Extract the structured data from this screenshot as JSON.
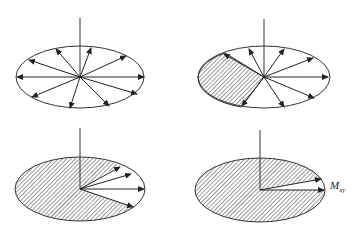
{
  "figure": {
    "stroke_color": "#333333",
    "hatch_color": "#555555",
    "panels": [
      {
        "id": "panel-1",
        "center": [
          80,
          77
        ],
        "rx": 64,
        "ry": 31,
        "axis_top": 18,
        "shaded": "none",
        "vector_angles_deg": [
          0,
          22,
          60,
          82,
          122,
          162,
          180,
          205,
          258,
          308,
          340
        ]
      },
      {
        "id": "panel-2",
        "center": [
          264,
          77
        ],
        "rx": 66,
        "ry": 31,
        "axis_top": 19,
        "shaded": "left-sector",
        "vector_angles_deg": [
          0,
          25,
          65,
          115,
          145,
          240,
          288,
          335
        ]
      },
      {
        "id": "panel-3",
        "center": [
          80,
          189
        ],
        "rx": 65,
        "ry": 32,
        "axis_top": 128,
        "shaded": "mostly",
        "vector_angles_deg": [
          0,
          25,
          40,
          335
        ]
      },
      {
        "id": "panel-4",
        "center": [
          260,
          190
        ],
        "rx": 65,
        "ry": 32,
        "axis_top": 130,
        "shaded": "mostly",
        "vector_angles_deg": [
          0,
          20
        ]
      }
    ],
    "label": {
      "main": "M",
      "subscript": "xy"
    }
  }
}
